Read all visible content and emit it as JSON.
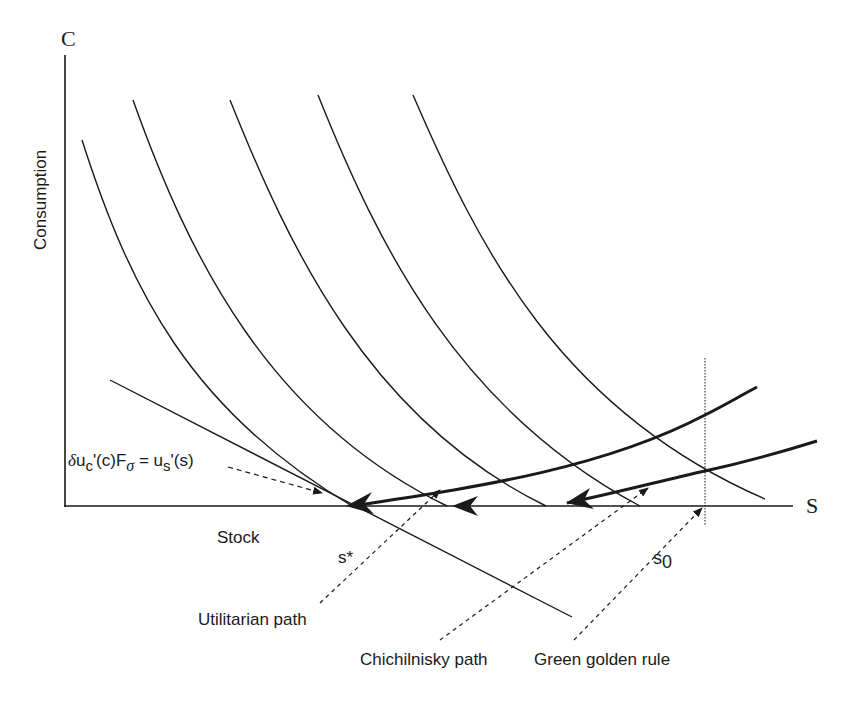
{
  "diagram": {
    "axes": {
      "y_axis_symbol": "C",
      "y_axis_label": "Consumption",
      "x_axis_symbol": "S",
      "x_axis_label": "Stock"
    },
    "points": {
      "s_star": "s*",
      "s0_base": "s",
      "s0_sub": "0"
    },
    "equation": {
      "delta": "δ",
      "u1": "u",
      "sub_c": "c",
      "mid": "'(c)F",
      "sub_sigma": "σ",
      "eq": " = u",
      "sub_s": "s",
      "end": "'(s)"
    },
    "annotations": [
      {
        "id": "utilitarian",
        "label": "Utilitarian path"
      },
      {
        "id": "chichilnisky",
        "label": "Chichilnisky path"
      },
      {
        "id": "green_golden",
        "label": "Green golden rule"
      }
    ],
    "colors": {
      "ink": "#1a1a1a",
      "background": "#ffffff"
    }
  }
}
